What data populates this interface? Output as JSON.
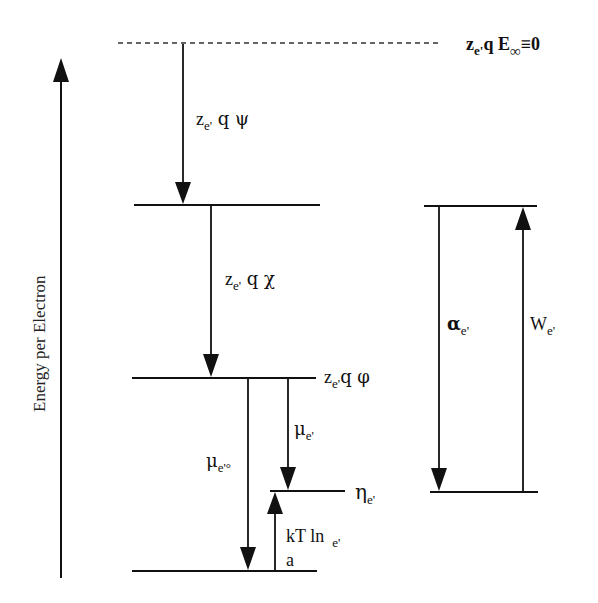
{
  "diagram": {
    "type": "energy-level-diagram",
    "axis": {
      "label": "Energy per Electron",
      "direction": "up"
    },
    "levels": [
      {
        "id": "vacuum",
        "style": "dashed",
        "label_main": "z",
        "label_sub": "e'",
        "label_rest": "q  E",
        "label_inf": "∞",
        "label_tail": "≡0"
      },
      {
        "id": "outer-potential",
        "style": "solid"
      },
      {
        "id": "inner-potential",
        "style": "solid",
        "label_main": "z",
        "label_sub": "e'",
        "label_rest": "q φ"
      },
      {
        "id": "electrochemical",
        "style": "solid",
        "label_main": "η",
        "label_sub": "e'"
      },
      {
        "id": "standard",
        "style": "solid"
      }
    ],
    "arrows": [
      {
        "id": "psi",
        "label_main": "z",
        "label_sub": "e'",
        "label_rest": " q ψ"
      },
      {
        "id": "chi",
        "label_main": "z",
        "label_sub": "e'",
        "label_rest": " q χ"
      },
      {
        "id": "mu-standard",
        "label_main": "μ",
        "label_sub": "e'°"
      },
      {
        "id": "mu",
        "label_main": "μ",
        "label_sub": "e'"
      },
      {
        "id": "kt-ln-a",
        "label_main": "kT  ln",
        "label_sub": "e'",
        "label_below": "a"
      },
      {
        "id": "alpha",
        "label_main": "α",
        "label_sub": "e'"
      },
      {
        "id": "work-function",
        "label_main": "W",
        "label_sub": "e'"
      }
    ]
  }
}
